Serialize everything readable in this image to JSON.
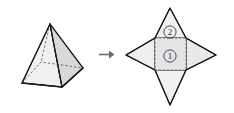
{
  "figure": {
    "background_color": "#ffffff",
    "stroke_color": "#1a1a1a",
    "dashed_color": "#555555",
    "arrow": {
      "icon": "right-arrow-icon",
      "glyph": "→",
      "color": "#6b6b6b"
    },
    "solid": {
      "name": "square-pyramid",
      "fill_light": "#f2f2f2",
      "fill_mid": "#e6e6e6",
      "fill_dark": "#d4d4d4",
      "vertices": {
        "apex": [
          50,
          24
        ],
        "base_left": [
          22,
          83
        ],
        "base_front": [
          62,
          87
        ],
        "base_right": [
          83,
          68
        ],
        "base_back": [
          41,
          62
        ]
      }
    },
    "net": {
      "name": "pyramid-net-star",
      "fill_light": "#f4f4f4",
      "fill_mid": "#ebebeb",
      "fill_dark": "#e0e0e0",
      "square_fill": "#e4e4e4",
      "center_square": [
        155,
        38,
        186,
        70
      ],
      "tips": {
        "top": [
          170,
          8
        ],
        "right": [
          216,
          55
        ],
        "bottom": [
          170,
          105
        ],
        "left": [
          126,
          55
        ]
      },
      "labels": [
        {
          "id": "face-label-1",
          "text": "①",
          "plain": "1",
          "x": 170,
          "y": 56
        },
        {
          "id": "face-label-2",
          "text": "②",
          "plain": "2",
          "x": 170,
          "y": 33
        }
      ]
    }
  }
}
